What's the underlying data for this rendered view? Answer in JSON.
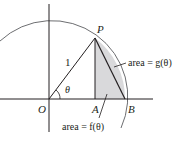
{
  "diagram": {
    "points": {
      "P": "P",
      "O": "O",
      "A": "A",
      "B": "B"
    },
    "radius_label": "1",
    "angle_label": "θ",
    "annotation_g": "area = g(θ)",
    "annotation_f": "area = f(θ)",
    "colors": {
      "line": "#231f20",
      "arc": "#6d6e71",
      "shade": "#d9d9db"
    }
  }
}
